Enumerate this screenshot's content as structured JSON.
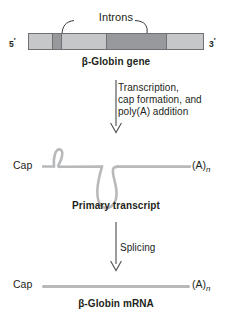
{
  "figure": {
    "colors": {
      "exon_light": "#c6c7c9",
      "intron_dark": "#98999c",
      "bar_outline": "#6f7073",
      "rna_strand": "#b7b9bb",
      "text": "#231f20",
      "arrow": "#58595b"
    }
  },
  "gene_stage": {
    "introns_label": "Introns",
    "five_prime": "5",
    "five_prime_mark": "′",
    "three_prime": "3",
    "three_prime_mark": "′",
    "caption": "β-Globin gene",
    "segments": [
      {
        "name": "exon-1",
        "type": "exon",
        "width_pct": 13.5,
        "color": "#c6c7c9"
      },
      {
        "name": "intron-1",
        "type": "intron",
        "width_pct": 5.0,
        "color": "#98999c"
      },
      {
        "name": "exon-2",
        "type": "exon",
        "width_pct": 25.5,
        "color": "#c6c7c9"
      },
      {
        "name": "intron-2",
        "type": "intron",
        "width_pct": 35.0,
        "color": "#98999c"
      },
      {
        "name": "exon-3",
        "type": "exon",
        "width_pct": 21.0,
        "color": "#c6c7c9"
      }
    ]
  },
  "step_one": {
    "line1": "Transcription,",
    "line2": "cap formation, and",
    "line3": "poly(A) addition"
  },
  "transcript_stage": {
    "cap_label": "Cap",
    "polya_label": "(A)",
    "polya_subscript": "n",
    "caption": "Primary transcript",
    "loops": [
      {
        "name": "intron-loop-small",
        "direction": "up"
      },
      {
        "name": "intron-loop-large",
        "direction": "down"
      }
    ]
  },
  "step_two": {
    "label": "Splicing"
  },
  "mrna_stage": {
    "cap_label": "Cap",
    "polya_label": "(A)",
    "polya_subscript": "n",
    "caption": "β-Globin mRNA"
  }
}
